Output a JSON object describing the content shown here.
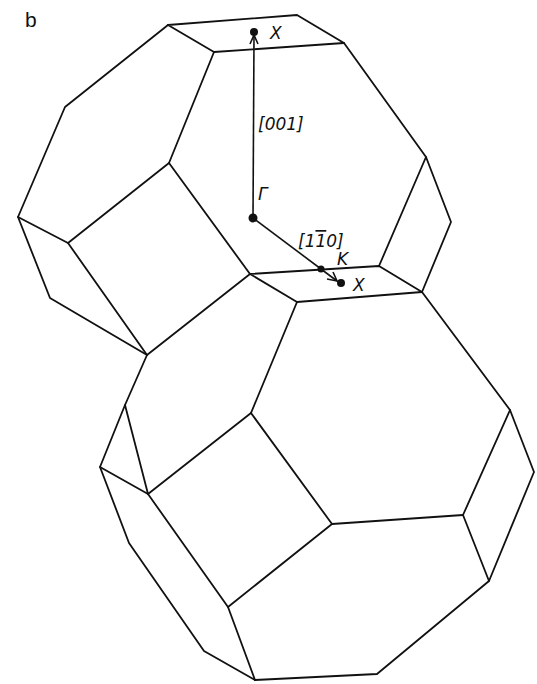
{
  "figure": {
    "panel_label": "b",
    "colors": {
      "line": "#111111",
      "background": "#ffffff"
    }
  },
  "points": {
    "gamma": {
      "label": "Γ",
      "x": 253,
      "y": 218
    },
    "x_top": {
      "label": "X",
      "x": 254,
      "y": 32
    },
    "x_side": {
      "label": "X",
      "x": 341,
      "y": 283
    },
    "k": {
      "label": "K",
      "x": 321,
      "y": 269
    }
  },
  "vectors": {
    "dir_001": {
      "label": "[001]",
      "from": "gamma",
      "to": "x_top"
    },
    "dir_1m10": {
      "label": "[1̅0]",
      "label_parts": [
        "[1",
        "1̄",
        "0]"
      ],
      "from": "gamma",
      "to": "x_side"
    }
  }
}
